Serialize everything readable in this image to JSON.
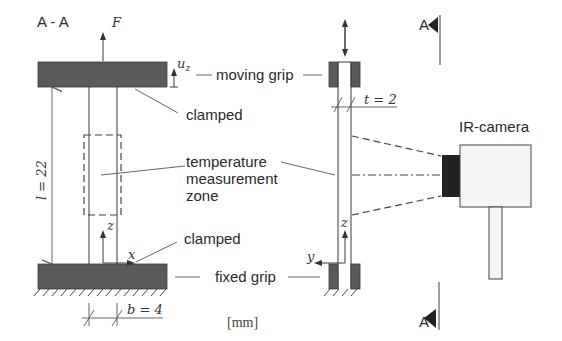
{
  "title": "A - A",
  "labels": {
    "force": "F",
    "displacement": "u",
    "displacement_sub": "z",
    "moving_grip": "moving grip",
    "clamped_top": "clamped",
    "temperature_zone_line1": "temperature",
    "temperature_zone_line2": "measurement",
    "temperature_zone_line3": "zone",
    "clamped_bottom": "clamped",
    "fixed_grip": "fixed grip",
    "length": "l = 22",
    "width": "b = 4",
    "thickness": "t = 2",
    "units": "[mm]",
    "camera": "IR-camera",
    "section_top": "A",
    "section_bottom": "A",
    "axis_z_front": "z",
    "axis_x_front": "x",
    "axis_z_side": "z",
    "axis_y_side": "y"
  },
  "colors": {
    "grip_fill": "#5a5a5a",
    "lens_fill": "#222222",
    "line": "#3a3a3a",
    "background": "#ffffff"
  }
}
